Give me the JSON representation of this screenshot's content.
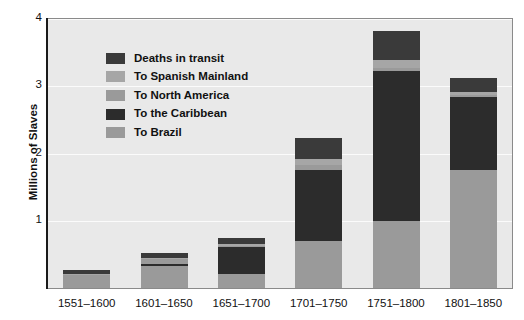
{
  "chart_data": {
    "type": "bar",
    "stacked": true,
    "title": "",
    "subtitle": "",
    "xlabel": "",
    "ylabel": "Millions of Slaves",
    "ylim": [
      0,
      4
    ],
    "yticks": [
      1,
      2,
      3,
      4
    ],
    "ytick_labels": [
      "1",
      "2",
      "3",
      "4"
    ],
    "grid": true,
    "legend_position": "upper-left inside plot",
    "categories": [
      "1551–1600",
      "1601–1650",
      "1651–1700",
      "1701–1750",
      "1751–1800",
      "1801–1850"
    ],
    "series": [
      {
        "name": "To Brazil",
        "color": "#9a9a9a",
        "values": [
          0.2,
          0.33,
          0.21,
          0.7,
          1.0,
          1.75
        ]
      },
      {
        "name": "To the Caribbean",
        "color": "#2c2c2c",
        "values": [
          0.0,
          0.03,
          0.4,
          1.06,
          2.22,
          1.09
        ]
      },
      {
        "name": "To North America",
        "color": "#9a9a9a",
        "values": [
          0.0,
          0.07,
          0.02,
          0.07,
          0.05,
          0.03
        ]
      },
      {
        "name": "To Spanish Mainland",
        "color": "#a6a6a6",
        "values": [
          0.01,
          0.01,
          0.03,
          0.09,
          0.12,
          0.05
        ]
      },
      {
        "name": "Deaths in transit",
        "color": "#3a3a3a",
        "values": [
          0.06,
          0.08,
          0.09,
          0.31,
          0.43,
          0.21
        ]
      }
    ],
    "totals": [
      0.27,
      0.52,
      0.75,
      2.23,
      3.82,
      3.13
    ],
    "colors": {
      "plot_background": "#e9e9e9",
      "gridline": "#fbfbfb",
      "axis": "#1a1a1a",
      "text": "#111111",
      "dark_segment": "#2c2c2c",
      "mid_dark_segment": "#3a3a3a",
      "light_gray_segment": "#9a9a9a",
      "lighter_gray_segment": "#a6a6a6"
    }
  },
  "legend": {
    "items": [
      {
        "label": "Deaths in transit",
        "swatch": "#3a3a3a"
      },
      {
        "label": "To Spanish Mainland",
        "swatch": "#a6a6a6"
      },
      {
        "label": "To North America",
        "swatch": "#9a9a9a"
      },
      {
        "label": "To the Caribbean",
        "swatch": "#2c2c2c"
      },
      {
        "label": "To Brazil",
        "swatch": "#9a9a9a"
      }
    ]
  },
  "axes": {
    "y_title": "Millions of Slaves",
    "y_labels": [
      "4",
      "3",
      "2",
      "1"
    ],
    "x_labels": [
      "1551–1600",
      "1601–1650",
      "1651–1700",
      "1701–1750",
      "1751–1800",
      "1801–1850"
    ]
  }
}
